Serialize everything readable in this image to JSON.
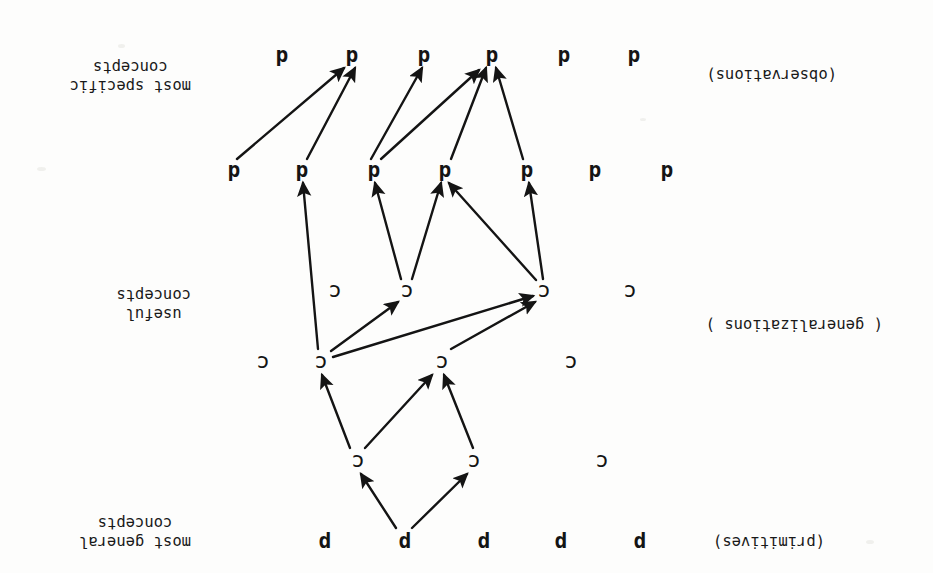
{
  "figure": {
    "orientation": "upside-down-scan",
    "rotation_degrees": 180,
    "background_color": "#fdfdfc",
    "ink_color": "#141414",
    "side_labels": [
      {
        "id": "top",
        "line1": "most general",
        "line2": "concepts",
        "x": 742,
        "y": 22
      },
      {
        "id": "middle",
        "line1": "useful",
        "line2": "concepts",
        "x": 742,
        "y": 250
      },
      {
        "id": "bottom",
        "line1": "most specific",
        "line2": "concepts",
        "x": 742,
        "y": 478
      }
    ],
    "row_labels": [
      {
        "id": "primitives",
        "text": "(primitives)",
        "x": 108,
        "y": 22
      },
      {
        "id": "generalizations",
        "text": "( generalizations )",
        "x": 50,
        "y": 239
      },
      {
        "id": "observations",
        "text": "(observations)",
        "x": 96,
        "y": 489
      }
    ],
    "rows": [
      {
        "id": "row-p",
        "symbol": "p",
        "kind": "primitive",
        "y": 31,
        "nodes": [
          {
            "id": "p1",
            "x": 293
          },
          {
            "id": "p2",
            "x": 372
          },
          {
            "id": "p3",
            "x": 449
          },
          {
            "id": "p4",
            "x": 528
          },
          {
            "id": "p5",
            "x": 608
          }
        ]
      },
      {
        "id": "row-c1",
        "symbol": "c",
        "kind": "concept",
        "y": 111,
        "nodes": [
          {
            "id": "c1a",
            "x": 331
          },
          {
            "id": "c1b",
            "x": 459
          },
          {
            "id": "c1c",
            "x": 575
          }
        ]
      },
      {
        "id": "row-c2",
        "symbol": "c",
        "kind": "concept",
        "y": 210,
        "nodes": [
          {
            "id": "c2a",
            "x": 362
          },
          {
            "id": "c2b",
            "x": 491
          },
          {
            "id": "c2c",
            "x": 612
          },
          {
            "id": "c2d",
            "x": 670
          }
        ]
      },
      {
        "id": "row-c3",
        "symbol": "c",
        "kind": "concept",
        "y": 281,
        "nodes": [
          {
            "id": "c3a",
            "x": 303
          },
          {
            "id": "c3b",
            "x": 389
          },
          {
            "id": "c3c",
            "x": 526
          },
          {
            "id": "c3d",
            "x": 598
          }
        ]
      },
      {
        "id": "row-d1",
        "symbol": "d",
        "kind": "datum",
        "y": 402,
        "nodes": [
          {
            "id": "d1a",
            "x": 266
          },
          {
            "id": "d1b",
            "x": 338
          },
          {
            "id": "d1c",
            "x": 406
          },
          {
            "id": "d1d",
            "x": 488
          },
          {
            "id": "d1e",
            "x": 559
          },
          {
            "id": "d1f",
            "x": 631
          },
          {
            "id": "d1g",
            "x": 699
          }
        ]
      },
      {
        "id": "row-d2",
        "symbol": "d",
        "kind": "datum",
        "y": 517,
        "nodes": [
          {
            "id": "d2a",
            "x": 299
          },
          {
            "id": "d2b",
            "x": 369
          },
          {
            "id": "d2c",
            "x": 441
          },
          {
            "id": "d2d",
            "x": 509
          },
          {
            "id": "d2e",
            "x": 581
          },
          {
            "id": "d2f",
            "x": 651
          }
        ]
      }
    ],
    "edges": [
      {
        "id": "e1",
        "from": "p4",
        "to": "c1b",
        "x1": 521,
        "y1": 45,
        "x2": 466,
        "y2": 99
      },
      {
        "id": "e2",
        "from": "p4",
        "to": "c1c",
        "x1": 537,
        "y1": 45,
        "x2": 572,
        "y2": 99
      },
      {
        "id": "e3",
        "from": "c1b",
        "to": "c2b",
        "x1": 460,
        "y1": 125,
        "x2": 489,
        "y2": 198
      },
      {
        "id": "e4",
        "from": "c1c",
        "to": "c2b",
        "x1": 568,
        "y1": 125,
        "x2": 501,
        "y2": 198
      },
      {
        "id": "e5",
        "from": "c1c",
        "to": "c2c",
        "x1": 583,
        "y1": 125,
        "x2": 611,
        "y2": 198
      },
      {
        "id": "e6",
        "from": "c2b",
        "to": "c3b",
        "x1": 482,
        "y1": 224,
        "x2": 398,
        "y2": 271
      },
      {
        "id": "e7",
        "from": "c2c",
        "to": "c3b",
        "x1": 600,
        "y1": 216,
        "x2": 400,
        "y2": 277
      },
      {
        "id": "e8",
        "from": "c2c",
        "to": "c3c",
        "x1": 602,
        "y1": 222,
        "x2": 535,
        "y2": 271
      },
      {
        "id": "e9",
        "from": "c3b",
        "to": "d1c",
        "x1": 390,
        "y1": 294,
        "x2": 404,
        "y2": 390
      },
      {
        "id": "e10",
        "from": "c3b",
        "to": "d1d",
        "x1": 397,
        "y1": 293,
        "x2": 484,
        "y2": 390
      },
      {
        "id": "e11",
        "from": "c3c",
        "to": "d1d",
        "x1": 521,
        "y1": 294,
        "x2": 492,
        "y2": 390
      },
      {
        "id": "e12",
        "from": "c3c",
        "to": "d1e",
        "x1": 532,
        "y1": 294,
        "x2": 558,
        "y2": 390
      },
      {
        "id": "e13",
        "from": "c2c",
        "to": "d1f",
        "x1": 615,
        "y1": 224,
        "x2": 630,
        "y2": 390
      },
      {
        "id": "e14",
        "from": "d1c",
        "to": "d2c",
        "x1": 410,
        "y1": 414,
        "x2": 437,
        "y2": 505
      },
      {
        "id": "e15",
        "from": "d1d",
        "to": "d2c",
        "x1": 482,
        "y1": 414,
        "x2": 447,
        "y2": 505
      },
      {
        "id": "e16",
        "from": "d1e",
        "to": "d2c",
        "x1": 552,
        "y1": 414,
        "x2": 454,
        "y2": 503
      },
      {
        "id": "e17",
        "from": "d1e",
        "to": "d2d",
        "x1": 562,
        "y1": 414,
        "x2": 511,
        "y2": 505
      },
      {
        "id": "e18",
        "from": "d1f",
        "to": "d2e",
        "x1": 626,
        "y1": 414,
        "x2": 578,
        "y2": 505
      },
      {
        "id": "e19",
        "from": "d1g",
        "to": "d2e",
        "x1": 696,
        "y1": 414,
        "x2": 589,
        "y2": 505
      }
    ]
  }
}
